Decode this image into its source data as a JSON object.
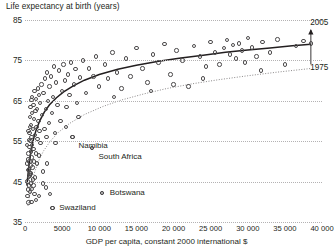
{
  "chart_data": {
    "type": "scatter",
    "title": "Life expectancy at birth (years)",
    "xlabel": "GDP per capita, constant 2000 international $",
    "ylabel": "Life expectancy at birth (years)",
    "xlim": [
      0,
      40000
    ],
    "ylim": [
      35,
      85
    ],
    "grid": true,
    "legend_position": "inline-annotation",
    "xticks": [
      0,
      5000,
      10000,
      15000,
      20000,
      25000,
      30000,
      35000,
      40000
    ],
    "xtick_labels": [
      "0",
      "5000",
      "10 000",
      "15 000",
      "20 000",
      "25 000",
      "30 000",
      "35 000",
      "40 000"
    ],
    "yticks": [
      35,
      45,
      55,
      65,
      75,
      85
    ],
    "ytick_labels": [
      "35",
      "45",
      "55",
      "65",
      "75",
      "85"
    ],
    "curve_labels": [
      {
        "name": "curve-2005-label",
        "text": "2005",
        "x": 38000,
        "y": 84.3
      },
      {
        "name": "curve-1975-label",
        "text": "1975",
        "x": 38000,
        "y": 73.2
      }
    ],
    "annotations": [
      {
        "name": "namibia",
        "text": "Namibia",
        "x": 6400,
        "y": 56.0,
        "label_x": 7200,
        "label_y": 53.9
      },
      {
        "name": "south-africa",
        "text": "South Africa",
        "x": 9000,
        "y": 53.3,
        "label_x": 9900,
        "label_y": 51.2
      },
      {
        "name": "botswana",
        "text": "Botswana",
        "x": 10400,
        "y": 42.2,
        "label_x": 11400,
        "label_y": 42.2
      },
      {
        "name": "swaziland",
        "text": "Swaziland",
        "x": 3700,
        "y": 38.5,
        "label_x": 4600,
        "label_y": 38.5
      }
    ],
    "series": [
      {
        "name": "2005 fitted curve",
        "style": "solid",
        "color": "#231f20",
        "points": [
          [
            250,
            44.0
          ],
          [
            500,
            48.5
          ],
          [
            800,
            52.4
          ],
          [
            1100,
            55.2
          ],
          [
            1500,
            57.8
          ],
          [
            2000,
            60.1
          ],
          [
            2600,
            62.2
          ],
          [
            3300,
            64.0
          ],
          [
            4200,
            65.7
          ],
          [
            5200,
            67.2
          ],
          [
            6500,
            68.7
          ],
          [
            8000,
            70.1
          ],
          [
            10000,
            71.5
          ],
          [
            12500,
            72.8
          ],
          [
            15000,
            73.8
          ],
          [
            18000,
            74.8
          ],
          [
            21000,
            75.6
          ],
          [
            24000,
            76.3
          ],
          [
            27000,
            77.0
          ],
          [
            30000,
            77.6
          ],
          [
            33000,
            78.1
          ],
          [
            36000,
            78.6
          ],
          [
            38500,
            79.0
          ]
        ]
      },
      {
        "name": "1975 fitted curve",
        "style": "dotted",
        "color": "#8b8889",
        "points": [
          [
            400,
            39.0
          ],
          [
            800,
            43.5
          ],
          [
            1200,
            46.8
          ],
          [
            1800,
            50.0
          ],
          [
            2500,
            52.6
          ],
          [
            3400,
            55.0
          ],
          [
            4500,
            57.2
          ],
          [
            6000,
            59.4
          ],
          [
            8000,
            61.6
          ],
          [
            10500,
            63.6
          ],
          [
            13000,
            65.2
          ],
          [
            16000,
            66.7
          ],
          [
            19000,
            68.0
          ],
          [
            22500,
            69.2
          ],
          [
            26000,
            70.2
          ],
          [
            30000,
            71.2
          ],
          [
            34000,
            72.1
          ],
          [
            38500,
            73.0
          ]
        ]
      }
    ],
    "points": [
      [
        320,
        45.0
      ],
      [
        340,
        41.5
      ],
      [
        380,
        47.8
      ],
      [
        400,
        43.0
      ],
      [
        420,
        50.5
      ],
      [
        450,
        39.8
      ],
      [
        470,
        52.0
      ],
      [
        500,
        46.2
      ],
      [
        520,
        55.3
      ],
      [
        540,
        48.0
      ],
      [
        560,
        44.0
      ],
      [
        580,
        57.0
      ],
      [
        600,
        50.0
      ],
      [
        620,
        53.5
      ],
      [
        640,
        42.5
      ],
      [
        660,
        58.5
      ],
      [
        680,
        46.5
      ],
      [
        700,
        61.0
      ],
      [
        720,
        55.0
      ],
      [
        740,
        49.0
      ],
      [
        760,
        63.5
      ],
      [
        780,
        52.5
      ],
      [
        800,
        44.5
      ],
      [
        820,
        59.0
      ],
      [
        840,
        47.0
      ],
      [
        860,
        65.2
      ],
      [
        880,
        56.0
      ],
      [
        900,
        51.0
      ],
      [
        920,
        43.2
      ],
      [
        940,
        62.0
      ],
      [
        960,
        54.0
      ],
      [
        980,
        66.0
      ],
      [
        1000,
        48.5
      ],
      [
        1040,
        58.0
      ],
      [
        1080,
        45.5
      ],
      [
        1120,
        64.0
      ],
      [
        1160,
        53.0
      ],
      [
        1200,
        60.5
      ],
      [
        1240,
        50.0
      ],
      [
        1280,
        67.5
      ],
      [
        1320,
        56.5
      ],
      [
        1360,
        46.0
      ],
      [
        1400,
        62.5
      ],
      [
        1450,
        52.0
      ],
      [
        1500,
        65.5
      ],
      [
        1550,
        58.5
      ],
      [
        1600,
        49.5
      ],
      [
        1650,
        63.0
      ],
      [
        1700,
        55.5
      ],
      [
        1750,
        68.0
      ],
      [
        1800,
        60.0
      ],
      [
        1850,
        51.5
      ],
      [
        1900,
        66.5
      ],
      [
        1950,
        57.5
      ],
      [
        2000,
        64.5
      ],
      [
        2100,
        54.5
      ],
      [
        2200,
        69.0
      ],
      [
        2300,
        61.5
      ],
      [
        2400,
        47.5
      ],
      [
        2500,
        67.0
      ],
      [
        2600,
        58.0
      ],
      [
        2700,
        70.5
      ],
      [
        2800,
        63.0
      ],
      [
        2900,
        56.0
      ],
      [
        3000,
        72.0
      ],
      [
        3100,
        65.0
      ],
      [
        3200,
        59.5
      ],
      [
        3300,
        68.5
      ],
      [
        3400,
        42.0
      ],
      [
        3500,
        71.0
      ],
      [
        3600,
        62.0
      ],
      [
        3700,
        38.5
      ],
      [
        3800,
        66.0
      ],
      [
        3900,
        73.5
      ],
      [
        4000,
        57.0
      ],
      [
        4200,
        69.5
      ],
      [
        4400,
        64.0
      ],
      [
        4600,
        72.5
      ],
      [
        4800,
        60.0
      ],
      [
        5000,
        67.5
      ],
      [
        5200,
        74.0
      ],
      [
        5400,
        70.0
      ],
      [
        5600,
        63.5
      ],
      [
        5800,
        71.5
      ],
      [
        6000,
        66.5
      ],
      [
        6200,
        74.5
      ],
      [
        6400,
        56.0
      ],
      [
        6600,
        69.0
      ],
      [
        6800,
        72.8
      ],
      [
        7000,
        64.5
      ],
      [
        7400,
        70.8
      ],
      [
        7800,
        75.0
      ],
      [
        8200,
        67.0
      ],
      [
        8600,
        73.0
      ],
      [
        9000,
        53.3
      ],
      [
        9200,
        71.0
      ],
      [
        9600,
        76.0
      ],
      [
        10000,
        68.5
      ],
      [
        10400,
        42.2
      ],
      [
        10800,
        74.0
      ],
      [
        11200,
        70.5
      ],
      [
        11800,
        77.0
      ],
      [
        12400,
        72.0
      ],
      [
        13000,
        68.0
      ],
      [
        13600,
        75.5
      ],
      [
        14200,
        71.0
      ],
      [
        15000,
        78.0
      ],
      [
        15800,
        73.0
      ],
      [
        16500,
        69.5
      ],
      [
        17200,
        76.5
      ],
      [
        18000,
        74.5
      ],
      [
        18800,
        79.0
      ],
      [
        19600,
        71.5
      ],
      [
        20400,
        77.5
      ],
      [
        21200,
        75.0
      ],
      [
        22000,
        68.5
      ],
      [
        22800,
        78.5
      ],
      [
        23600,
        76.0
      ],
      [
        24400,
        73.5
      ],
      [
        25000,
        79.5
      ],
      [
        25600,
        77.0
      ],
      [
        26200,
        74.0
      ],
      [
        26800,
        78.0
      ],
      [
        27200,
        80.0
      ],
      [
        27600,
        76.5
      ],
      [
        28000,
        78.8
      ],
      [
        28400,
        75.5
      ],
      [
        28800,
        79.2
      ],
      [
        29200,
        77.5
      ],
      [
        29600,
        74.5
      ],
      [
        30000,
        80.5
      ],
      [
        30600,
        78.2
      ],
      [
        31200,
        76.0
      ],
      [
        32000,
        79.5
      ],
      [
        33000,
        77.0
      ],
      [
        34000,
        80.2
      ],
      [
        35000,
        74.0
      ],
      [
        36500,
        78.5
      ],
      [
        37500,
        79.8
      ],
      [
        38500,
        79.2
      ],
      [
        31800,
        72.5
      ],
      [
        24000,
        70.5
      ],
      [
        20000,
        69.0
      ],
      [
        17000,
        67.5
      ],
      [
        12000,
        66.0
      ],
      [
        7200,
        61.0
      ],
      [
        5500,
        58.5
      ],
      [
        4100,
        54.5
      ],
      [
        3000,
        49.5
      ],
      [
        2450,
        44.5
      ],
      [
        1900,
        41.5
      ],
      [
        1500,
        40.5
      ],
      [
        1150,
        44.0
      ],
      [
        900,
        40.0
      ],
      [
        650,
        47.0
      ],
      [
        480,
        57.5
      ],
      [
        300,
        54.0
      ],
      [
        260,
        49.5
      ],
      [
        2800,
        43.5
      ],
      [
        1300,
        42.0
      ]
    ]
  }
}
